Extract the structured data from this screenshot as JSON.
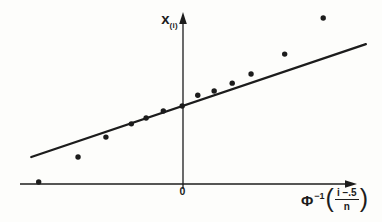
{
  "figure": {
    "background": "#fdfdfb",
    "ink": "#1c1c1c"
  },
  "labels": {
    "y_axis": {
      "base": "x",
      "sub": "(i)"
    },
    "origin": "0",
    "x_axis": {
      "phi": "Φ",
      "exponent": "−1",
      "open_paren": "(",
      "numerator": "i −.5",
      "denominator": "n",
      "close_paren": ")"
    }
  },
  "chart_data": {
    "type": "scatter",
    "title": "",
    "xlabel": "Φ⁻¹((i −.5)/n)",
    "ylabel": "x(i)",
    "xlim": [
      -2.0,
      2.45
    ],
    "ylim": [
      -0.15,
      4.2
    ],
    "grid": false,
    "legend": false,
    "x_ticks": [
      {
        "value": 0,
        "label": "0"
      }
    ],
    "y_ticks": [],
    "points": [
      {
        "i": 1,
        "x": -1.76,
        "y": 0.05
      },
      {
        "i": 2,
        "x": -1.28,
        "y": 0.65
      },
      {
        "i": 3,
        "x": -0.94,
        "y": 1.13
      },
      {
        "i": 4,
        "x": -0.63,
        "y": 1.45
      },
      {
        "i": 5,
        "x": -0.45,
        "y": 1.59
      },
      {
        "i": 6,
        "x": -0.24,
        "y": 1.76
      },
      {
        "i": 7,
        "x": -0.01,
        "y": 1.88
      },
      {
        "i": 8,
        "x": 0.18,
        "y": 2.14
      },
      {
        "i": 9,
        "x": 0.38,
        "y": 2.24
      },
      {
        "i": 10,
        "x": 0.6,
        "y": 2.43
      },
      {
        "i": 11,
        "x": 0.83,
        "y": 2.65
      },
      {
        "i": 12,
        "x": 1.24,
        "y": 3.13
      },
      {
        "i": 13,
        "x": 1.71,
        "y": 4.0
      }
    ],
    "fit_line": {
      "from": {
        "x": -1.85,
        "y": 0.65
      },
      "to": {
        "x": 2.23,
        "y": 3.37
      }
    }
  }
}
